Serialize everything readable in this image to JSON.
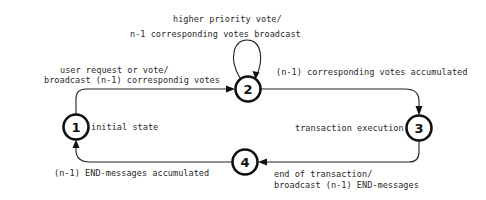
{
  "diagram": {
    "type": "state-transition",
    "states": [
      {
        "id": "1",
        "label": "1",
        "description": "initial state",
        "cx": 76,
        "cy": 127
      },
      {
        "id": "2",
        "label": "2",
        "description": "",
        "cx": 248,
        "cy": 89
      },
      {
        "id": "3",
        "label": "3",
        "description": "transaction execution",
        "cx": 419,
        "cy": 128
      },
      {
        "id": "4",
        "label": "4",
        "description": "",
        "cx": 245,
        "cy": 162
      }
    ],
    "transitions": [
      {
        "from": "1",
        "to": "2",
        "label_lines": [
          "user request or vote/",
          "broadcast (n-1) correspondig votes"
        ]
      },
      {
        "from": "2",
        "to": "2",
        "label_lines": [
          "higher priority vote/",
          "n-1 corresponding votes broadcast"
        ]
      },
      {
        "from": "2",
        "to": "3",
        "label_lines": [
          "(n-1) corresponding votes accumulated"
        ]
      },
      {
        "from": "3",
        "to": "4",
        "label_lines": [
          "end of transaction/",
          "broadcast (n-1) END-messages"
        ]
      },
      {
        "from": "4",
        "to": "1",
        "label_lines": [
          "(n-1) END-messages accumulated"
        ]
      }
    ],
    "labels": {
      "t12_line1": "user request or vote/",
      "t12_line2": "broadcast (n-1) correspondig votes",
      "t22_line1": "higher priority vote/",
      "t22_line2": "n-1 corresponding votes broadcast",
      "t23": "(n-1) corresponding votes accumulated",
      "t34_line1": "end of transaction/",
      "t34_line2": "broadcast (n-1) END-messages",
      "t41": "(n-1) END-messages accumulated",
      "s1_desc": "initial state",
      "s3_desc": "transaction execution"
    },
    "node_numbers": {
      "n1": "1",
      "n2": "2",
      "n3": "3",
      "n4": "4"
    }
  }
}
